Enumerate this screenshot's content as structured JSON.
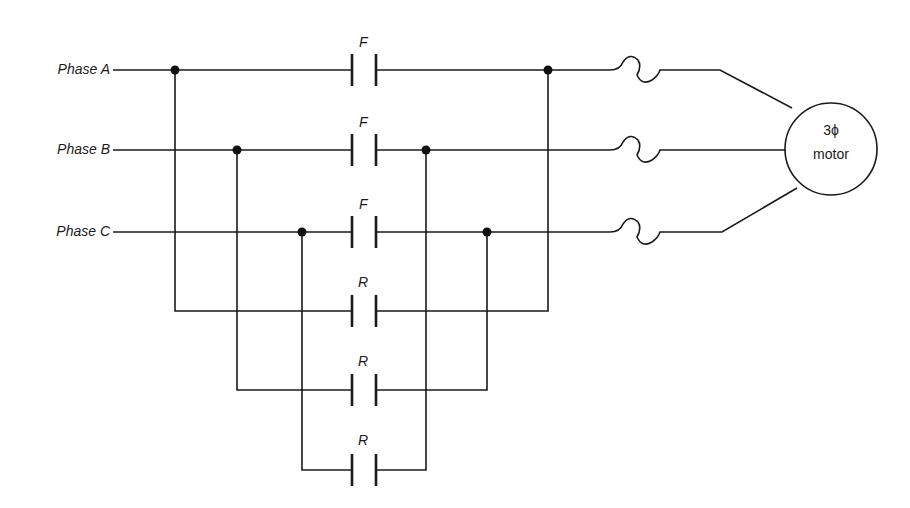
{
  "diagram": {
    "type": "forward-reverse three-phase motor starter schematic",
    "phases": [
      {
        "label": "Phase A"
      },
      {
        "label": "Phase B"
      },
      {
        "label": "Phase C"
      }
    ],
    "forward_contacts": [
      {
        "label": "F"
      },
      {
        "label": "F"
      },
      {
        "label": "F"
      }
    ],
    "reverse_contacts": [
      {
        "label": "R"
      },
      {
        "label": "R"
      },
      {
        "label": "R"
      }
    ],
    "fuses": 3,
    "motor": {
      "line1": "3ϕ",
      "line2": "motor"
    },
    "colors": {
      "line": "#1a1a1a",
      "background": "#ffffff"
    }
  }
}
